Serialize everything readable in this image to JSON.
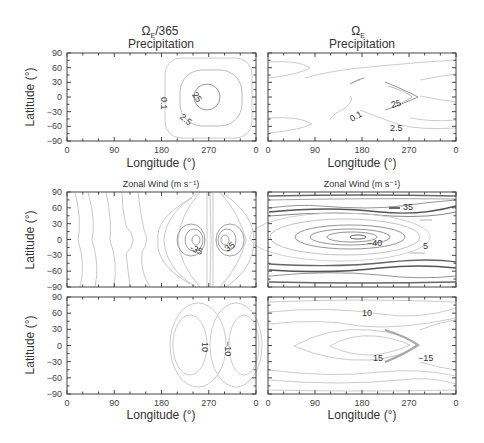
{
  "columns": [
    {
      "title_main": "Ω",
      "title_sub": "E",
      "title_suffix": "/365",
      "x_center": 161
    },
    {
      "title_main": "Ω",
      "title_sub": "E",
      "title_suffix": "",
      "x_center": 362
    }
  ],
  "axes": {
    "xlabel": "Longitude (°)",
    "ylabel": "Latitude (°)",
    "xticks": [
      "0",
      "90",
      "180",
      "270",
      "0"
    ],
    "yticks": [
      "90",
      "60",
      "30",
      "0",
      "−30",
      "−60",
      "−90"
    ]
  },
  "rows": [
    {
      "name": "precipitation",
      "label": "Precipitation"
    },
    {
      "name": "zonal-wind",
      "label": "Zonal Wind (m s⁻¹)"
    },
    {
      "name": "meridional",
      "label": ""
    }
  ],
  "chart_data": [
    {
      "type": "contour",
      "panel": "slow-rotation-precipitation",
      "title": "Ω_E/365 Precipitation",
      "xlabel": "Longitude (°)",
      "ylabel": "Latitude (°)",
      "xlim": [
        0,
        360
      ],
      "ylim": [
        -90,
        90
      ],
      "contour_labels": [
        "0.1",
        "2.5",
        "25"
      ],
      "description": "Concentric rounded-square contours centered near 270° longitude, equator"
    },
    {
      "type": "contour",
      "panel": "earth-rotation-precipitation",
      "title": "Ω_E Precipitation",
      "xlabel": "Longitude (°)",
      "ylabel": "Latitude (°)",
      "xlim": [
        0,
        360
      ],
      "ylim": [
        -90,
        90
      ],
      "contour_labels": [
        "0.1",
        "25",
        "2.5"
      ],
      "description": "Chevron-shaped maximum near 240-290° longitude, equatorial bands"
    },
    {
      "type": "contour",
      "panel": "slow-rotation-zonal-wind",
      "title": "Zonal Wind (m s⁻¹)",
      "xlim": [
        0,
        360
      ],
      "ylim": [
        -90,
        90
      ],
      "contour_labels": [
        "-35",
        "0",
        "35",
        "0"
      ],
      "description": "Dipole around 270° longitude: easterly -35 west, westerly 35 east"
    },
    {
      "type": "contour",
      "panel": "earth-rotation-zonal-wind",
      "title": "Zonal Wind (m s⁻¹)",
      "xlim": [
        0,
        360
      ],
      "ylim": [
        -90,
        90
      ],
      "contour_labels": [
        "35",
        "-40",
        "5"
      ],
      "description": "Zonal jets near ±60° latitude (35), equatorial easterly core -40 near 180°"
    },
    {
      "type": "contour",
      "panel": "slow-rotation-bottom",
      "xlim": [
        0,
        360
      ],
      "ylim": [
        -90,
        90
      ],
      "xlabel": "Longitude (°)",
      "contour_labels": [
        "10",
        "-10"
      ],
      "description": "Two oval lobes around 220° (10) and 300° (-10)"
    },
    {
      "type": "contour",
      "panel": "earth-rotation-bottom",
      "xlim": [
        0,
        360
      ],
      "ylim": [
        -90,
        90
      ],
      "xlabel": "Longitude (°)",
      "contour_labels": [
        "10",
        "15",
        "-15"
      ],
      "description": "Arrowhead pattern pointing east near 280° longitude"
    }
  ]
}
